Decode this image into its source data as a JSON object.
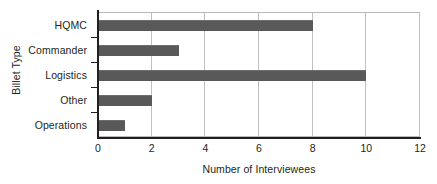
{
  "chart_data": {
    "type": "bar",
    "orientation": "horizontal",
    "title": "",
    "xlabel": "Number of Interviewees",
    "ylabel": "Billet Type",
    "categories": [
      "HQMC",
      "Commander",
      "Logistics",
      "Other",
      "Operations"
    ],
    "values": [
      8,
      3,
      10,
      2,
      1
    ],
    "series": [
      {
        "name": "Number of Interviewees",
        "values": [
          8,
          3,
          10,
          2,
          1
        ]
      }
    ],
    "xlim": [
      0,
      12
    ],
    "xticks": [
      0,
      2,
      4,
      6,
      8,
      10,
      12
    ],
    "xtick_labels": [
      "0",
      "2",
      "4",
      "6",
      "8",
      "10",
      "12"
    ],
    "grid": "vertical",
    "legend": "none",
    "bar_color": "#595959",
    "gridline_color": "#bfbfbf",
    "axis_color": "#231f20",
    "background_color": "#ffffff"
  }
}
